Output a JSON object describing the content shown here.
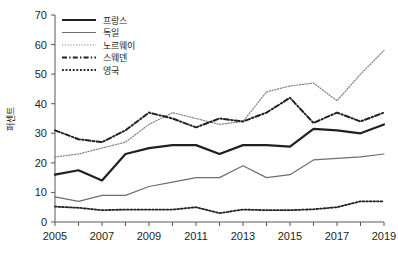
{
  "chart_data": {
    "type": "line",
    "title": "",
    "xlabel": "",
    "ylabel": "퍼센트",
    "ylim": [
      0,
      70
    ],
    "xlim": [
      2005,
      2019
    ],
    "ytick_step": 10,
    "yticks": [
      "0",
      "10",
      "20",
      "30",
      "40",
      "50",
      "60",
      "70"
    ],
    "xticks_labeled": [
      "2005",
      "2007",
      "2009",
      "2011",
      "2013",
      "2015",
      "2017",
      "2019"
    ],
    "x": [
      2005,
      2006,
      2007,
      2008,
      2009,
      2010,
      2011,
      2012,
      2013,
      2014,
      2015,
      2016,
      2017,
      2018,
      2019
    ],
    "grid": false,
    "legend_position": "top-left",
    "series": [
      {
        "name": "프랑스",
        "style": "solid-thick",
        "color": "#231f20",
        "values": [
          16,
          17.5,
          14,
          23,
          25,
          26,
          26,
          23,
          26,
          26,
          25.5,
          31.5,
          31,
          30,
          33
        ]
      },
      {
        "name": "독일",
        "style": "solid-thin",
        "color": "#6d6e71",
        "values": [
          8.5,
          7,
          9,
          9,
          12,
          13.5,
          15,
          15,
          19,
          15,
          16,
          21,
          21.5,
          22,
          23
        ]
      },
      {
        "name": "노르웨이",
        "style": "dotted-fine",
        "color": "#808285",
        "values": [
          22,
          23,
          25,
          27,
          33,
          37,
          35,
          33,
          34,
          44,
          46,
          47,
          41,
          50,
          58
        ]
      },
      {
        "name": "스웨덴",
        "style": "dash-dot",
        "color": "#231f20",
        "values": [
          31,
          28,
          27,
          31,
          37,
          35,
          32,
          35,
          34,
          37,
          42,
          33.5,
          37,
          34,
          37
        ]
      },
      {
        "name": "영국",
        "style": "dotted-medium",
        "color": "#231f20",
        "values": [
          5.2,
          4.8,
          4,
          4.2,
          4.2,
          4.2,
          5,
          3,
          4.2,
          4,
          4,
          4.3,
          5,
          7,
          7
        ]
      }
    ]
  }
}
